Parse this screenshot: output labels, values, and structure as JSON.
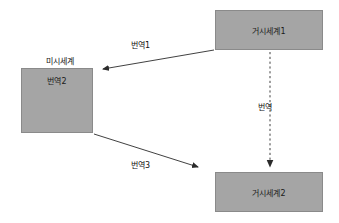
{
  "diagram": {
    "background_color": "#ffffff",
    "box_fill_color": "#a5a5a5",
    "box_border_color": "#8a8a8a",
    "line_color": "#2b2b2b",
    "text_color": "#111111",
    "nodes": [
      {
        "id": "macro1",
        "label": "거시세계1",
        "shape": "rectangle",
        "x": 215,
        "y": 10,
        "width": 108,
        "height": 40
      },
      {
        "id": "macro2",
        "label": "거시세계2",
        "shape": "rectangle",
        "x": 215,
        "y": 172,
        "width": 108,
        "height": 40
      },
      {
        "id": "micro",
        "label": "번역2",
        "outer_label": "미시세계",
        "shape": "rectangle",
        "x": 21,
        "y": 68,
        "width": 72,
        "height": 65
      }
    ],
    "edges": [
      {
        "id": "edge-translate-1",
        "label": "번역1",
        "style": "solid",
        "from": "macro1",
        "to": "micro",
        "label_x": 131,
        "label_y": 39
      },
      {
        "id": "edge-translate-middle",
        "label": "번역",
        "style": "dashed",
        "from": "macro1",
        "to": "macro2",
        "label_x": 258,
        "label_y": 101
      },
      {
        "id": "edge-translate-3",
        "label": "번역3",
        "style": "solid",
        "from": "micro",
        "to": "macro2",
        "label_x": 131,
        "label_y": 159
      }
    ],
    "micro_particles": [
      {
        "id": "particle-arrow-1",
        "direction": "up-left"
      },
      {
        "id": "particle-arrow-2",
        "direction": "left"
      },
      {
        "id": "particle-arrow-3",
        "direction": "up-left"
      },
      {
        "id": "particle-arrow-4",
        "direction": "right"
      },
      {
        "id": "particle-arrow-5",
        "direction": "down"
      }
    ]
  }
}
